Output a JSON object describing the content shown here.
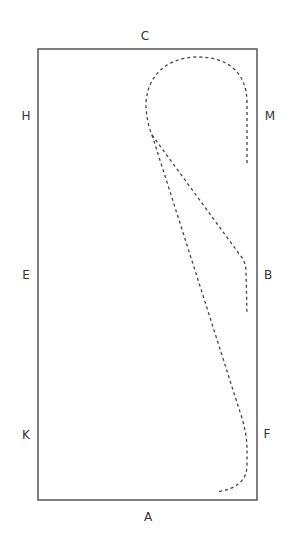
{
  "diagram": {
    "type": "dressage-arena-figure",
    "arena": {
      "x": 38,
      "y": 49,
      "width": 219,
      "height": 451,
      "stroke": "#555555"
    },
    "markers": [
      {
        "id": "C",
        "label": "C",
        "x": 145,
        "y": 36
      },
      {
        "id": "H",
        "label": "H",
        "x": 26,
        "y": 116
      },
      {
        "id": "M",
        "label": "M",
        "x": 270,
        "y": 116
      },
      {
        "id": "E",
        "label": "E",
        "x": 26,
        "y": 275
      },
      {
        "id": "B",
        "label": "B",
        "x": 268,
        "y": 275
      },
      {
        "id": "K",
        "label": "K",
        "x": 26,
        "y": 435
      },
      {
        "id": "F",
        "label": "F",
        "x": 267,
        "y": 434
      },
      {
        "id": "A",
        "label": "A",
        "x": 148,
        "y": 517
      }
    ],
    "paths": [
      {
        "name": "loop-at-M",
        "d": "M 247 163 L 247 103 C 247 70 225 57 198 57 C 165 57 145 78 146 108 C 147 120 149 128 152 135",
        "style": "dashed"
      },
      {
        "name": "line-to-B",
        "d": "M 152 135 L 240 255 Q 246 262 246 272 L 247 314",
        "style": "dashed"
      },
      {
        "name": "line-to-F",
        "d": "M 152 135 L 240 412 Q 247 432 247 450 L 247 465 Q 247 488 216 492",
        "style": "dashed"
      }
    ],
    "line_color": "#444444"
  }
}
